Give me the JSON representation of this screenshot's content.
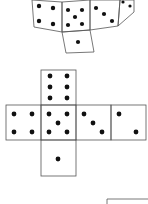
{
  "diagram": {
    "type": "dice-net-puzzle",
    "colors": {
      "line": "#555555",
      "pip": "#111111",
      "background": "#ffffff"
    },
    "folded_view": {
      "description": "partially folded cube (cropped at top)",
      "faces": [
        {
          "position": "left",
          "pips": 4
        },
        {
          "position": "front",
          "pips": 5
        },
        {
          "position": "right-slanted",
          "pips": 3
        },
        {
          "position": "far-right",
          "pips": 2
        },
        {
          "position": "bottom-flap",
          "pips": 1
        }
      ]
    },
    "net": {
      "description": "cross-shaped cube net",
      "top": {
        "pips": 6
      },
      "row": [
        {
          "pips": 4
        },
        {
          "pips": 5
        },
        {
          "pips": 3
        },
        {
          "pips": 2
        }
      ],
      "bottom": {
        "pips": 1
      }
    },
    "answer_box": {
      "description": "partial empty box at bottom-right (cropped)"
    }
  }
}
